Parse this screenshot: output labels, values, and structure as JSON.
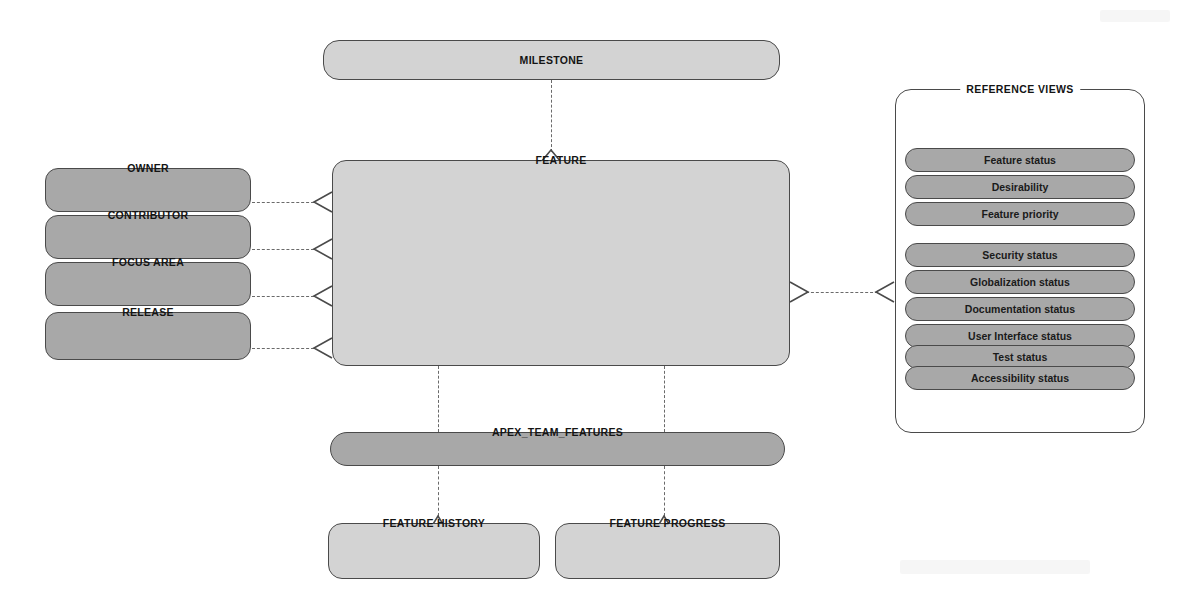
{
  "diagram": {
    "type": "entity-relationship-diagram",
    "background_color": "#ffffff",
    "line_color": "#4a4a4a",
    "connector_style": "dashed"
  },
  "entities": {
    "milestone": {
      "label": "MILESTONE",
      "fill": "#d3d3d3",
      "shape": "rounded-rect"
    },
    "feature": {
      "label": "FEATURE",
      "fill": "#d3d3d3",
      "shape": "rounded-rect"
    },
    "apex_team_features": {
      "label": "APEX_TEAM_FEATURES",
      "fill": "#a8a8a8",
      "shape": "pill"
    },
    "feature_history": {
      "label": "FEATURE HISTORY",
      "fill": "#d3d3d3",
      "shape": "rounded-rect"
    },
    "feature_progress": {
      "label": "FEATURE PROGRESS",
      "fill": "#d3d3d3",
      "shape": "rounded-rect"
    }
  },
  "left_entities": [
    {
      "label": "OWNER",
      "fill": "#a8a8a8"
    },
    {
      "label": "CONTRIBUTOR",
      "fill": "#a8a8a8"
    },
    {
      "label": "FOCUS AREA",
      "fill": "#a8a8a8"
    },
    {
      "label": "RELEASE",
      "fill": "#a8a8a8"
    }
  ],
  "reference_views": {
    "title": "REFERENCE VIEWS",
    "panel_fill": "#ffffff",
    "pill_fill": "#a8a8a8",
    "groups": [
      {
        "items": [
          {
            "label": "Feature status"
          },
          {
            "label": "Desirability"
          },
          {
            "label": "Feature priority"
          }
        ]
      },
      {
        "items": [
          {
            "label": "Security status"
          },
          {
            "label": "Globalization status"
          },
          {
            "label": "Documentation status"
          },
          {
            "label": "User Interface status"
          },
          {
            "label": "Test status"
          },
          {
            "label": "Accessibility status"
          }
        ]
      }
    ]
  },
  "relationships": [
    {
      "from": "MILESTONE",
      "to": "FEATURE",
      "style": "dashed",
      "marker": "crows-foot-up"
    },
    {
      "from": "OWNER",
      "to": "FEATURE",
      "style": "dashed",
      "marker": "crows-foot-left"
    },
    {
      "from": "CONTRIBUTOR",
      "to": "FEATURE",
      "style": "dashed",
      "marker": "crows-foot-left"
    },
    {
      "from": "FOCUS AREA",
      "to": "FEATURE",
      "style": "dashed",
      "marker": "crows-foot-left"
    },
    {
      "from": "RELEASE",
      "to": "FEATURE",
      "style": "dashed",
      "marker": "crows-foot-left"
    },
    {
      "from": "FEATURE",
      "to": "REFERENCE VIEWS",
      "style": "dashed",
      "marker": "crows-foot-both"
    },
    {
      "from": "FEATURE",
      "to": "APEX_TEAM_FEATURES",
      "style": "dashed",
      "marker": "none"
    },
    {
      "from": "APEX_TEAM_FEATURES",
      "to": "FEATURE HISTORY",
      "style": "dashed",
      "marker": "crows-foot-up"
    },
    {
      "from": "APEX_TEAM_FEATURES",
      "to": "FEATURE PROGRESS",
      "style": "dashed",
      "marker": "crows-foot-up"
    }
  ]
}
